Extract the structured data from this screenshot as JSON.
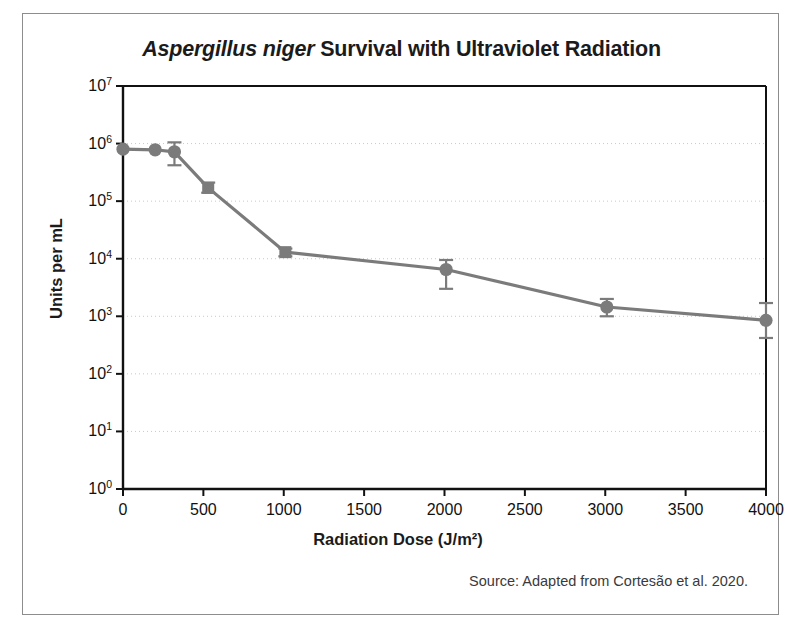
{
  "figure": {
    "title_species": "Aspergillus niger",
    "title_rest": " Survival with Ultraviolet Radiation",
    "source_note": "Source: Adapted from Cortesão et al. 2020."
  },
  "chart_data": {
    "type": "line",
    "title": "Aspergillus niger Survival with Ultraviolet Radiation",
    "xlabel": "Radiation Dose (J/m²)",
    "ylabel": "Units per mL",
    "yscale": "log",
    "xlim": [
      0,
      4000
    ],
    "ylim": [
      1,
      10000000
    ],
    "grid": true,
    "grid_style": "dotted-horizontal",
    "legend": null,
    "series_color": "#7b7b7b",
    "xticks": [
      0,
      500,
      1000,
      1500,
      2000,
      2500,
      3000,
      3500,
      4000
    ],
    "xtick_labels": [
      "0",
      "500",
      "1000",
      "1500",
      "2000",
      "2500",
      "3000",
      "3500",
      "4000"
    ],
    "yticks": [
      1,
      10,
      100,
      1000,
      10000,
      100000,
      1000000,
      10000000
    ],
    "ytick_labels": [
      "10⁰",
      "10¹",
      "10²",
      "10³",
      "10⁴",
      "10⁵",
      "10⁶",
      "10⁷"
    ],
    "ytick_exponents": [
      "0",
      "1",
      "2",
      "3",
      "4",
      "5",
      "6",
      "7"
    ],
    "points": [
      {
        "x": 0,
        "y": 800000,
        "err_low": 800000,
        "err_high": 800000,
        "marker": "circle"
      },
      {
        "x": 200,
        "y": 780000,
        "err_low": 780000,
        "err_high": 780000,
        "marker": "circle"
      },
      {
        "x": 320,
        "y": 720000,
        "err_low": 420000,
        "err_high": 1050000,
        "marker": "circle"
      },
      {
        "x": 530,
        "y": 170000,
        "err_low": 140000,
        "err_high": 210000,
        "marker": "square"
      },
      {
        "x": 1010,
        "y": 13000,
        "err_low": 11000,
        "err_high": 15000,
        "marker": "square"
      },
      {
        "x": 2010,
        "y": 6500,
        "err_low": 3000,
        "err_high": 9500,
        "marker": "circle"
      },
      {
        "x": 3010,
        "y": 1450,
        "err_low": 1000,
        "err_high": 2000,
        "marker": "circle"
      },
      {
        "x": 4000,
        "y": 850,
        "err_low": 420,
        "err_high": 1700,
        "marker": "circle"
      }
    ]
  }
}
